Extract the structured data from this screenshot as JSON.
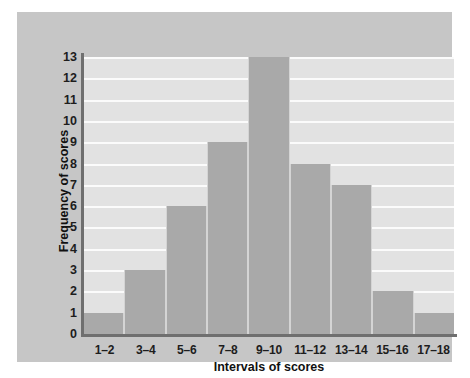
{
  "chart_data": {
    "type": "bar",
    "title": "",
    "xlabel": "Intervals of scores",
    "ylabel": "Frequency of scores",
    "categories": [
      "1–2",
      "3–4",
      "5–6",
      "7–8",
      "9–10",
      "11–12",
      "13–14",
      "15–16",
      "17–18"
    ],
    "values": [
      1,
      3,
      6,
      9,
      13,
      8,
      7,
      2,
      1
    ],
    "ylim": [
      0,
      13
    ],
    "yticks": [
      0,
      1,
      2,
      3,
      4,
      5,
      6,
      7,
      8,
      9,
      10,
      11,
      12,
      13
    ],
    "ytick_labels": [
      "0",
      "1",
      "2",
      "3",
      "4",
      "5",
      "6",
      "7",
      "8",
      "9",
      "10",
      "11",
      "12",
      "13"
    ],
    "grid": true,
    "grid_axis": "y",
    "legend": false,
    "bar_color": "#a9a9a9",
    "plot_background": "#e2e2e2",
    "card_background": "#c6c6c6",
    "gridline_color": "#fbfbfb",
    "axis_color": "#6f6f6f",
    "text_color": "#1d1d1d"
  }
}
